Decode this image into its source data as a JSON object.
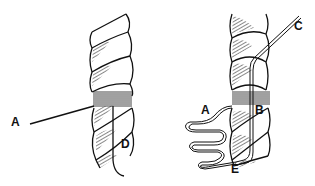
{
  "diagram": {
    "type": "rope whipping illustration",
    "panels": [
      {
        "id": "left",
        "labels": [
          {
            "text": "A",
            "x": 11,
            "y": 122
          },
          {
            "text": "D",
            "x": 123,
            "y": 137
          }
        ]
      },
      {
        "id": "right",
        "labels": [
          {
            "text": "A",
            "x": 200,
            "y": 110
          },
          {
            "text": "B",
            "x": 256,
            "y": 106
          },
          {
            "text": "C",
            "x": 294,
            "y": 22
          },
          {
            "text": "E",
            "x": 234,
            "y": 163
          }
        ]
      }
    ],
    "colors": {
      "ink": "#111111",
      "background": "#ffffff"
    }
  }
}
